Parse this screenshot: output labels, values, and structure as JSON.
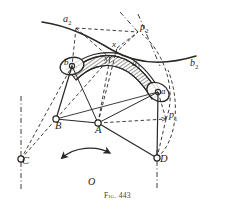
{
  "figure": {
    "caption": "Fig. 443",
    "center_label": "O",
    "ink_color": "#2a2724",
    "background_color": "#ffffff"
  },
  "labels": {
    "a2": {
      "base": "a",
      "sub": "2"
    },
    "p2": {
      "base": "p",
      "sub": "2"
    },
    "b2": {
      "base": "b",
      "sub": "2"
    },
    "a1": {
      "base": "a",
      "sub": "1"
    },
    "p1": {
      "base": "p",
      "sub": "1"
    },
    "x_upper": {
      "base": "x",
      "sub": ""
    },
    "x_lower": {
      "base": "x",
      "sub": ""
    },
    "a_joint": {
      "base": "a",
      "sub": ""
    },
    "b_joint": {
      "base": "b",
      "sub": ""
    },
    "A": {
      "base": "A",
      "sub": ""
    },
    "B": {
      "base": "B",
      "sub": ""
    },
    "C": {
      "base": "C",
      "sub": ""
    },
    "D": {
      "base": "D",
      "sub": ""
    }
  },
  "geometry": {
    "points": {
      "A": {
        "x": 98,
        "y": 123,
        "name": "pivot-A"
      },
      "B": {
        "x": 56,
        "y": 119,
        "name": "pivot-B"
      },
      "C": {
        "x": 21,
        "y": 159,
        "name": "pivot-C"
      },
      "D": {
        "x": 157,
        "y": 158,
        "name": "pivot-D"
      },
      "joint_a": {
        "x": 158,
        "y": 92,
        "name": "joint-a"
      },
      "joint_b": {
        "x": 72,
        "y": 65,
        "name": "joint-b"
      },
      "p1": {
        "x": 166,
        "y": 119,
        "name": "point-p1"
      },
      "p2": {
        "x": 140,
        "y": 30,
        "name": "point-p2"
      },
      "a2": {
        "x": 76,
        "y": 26,
        "name": "point-a2"
      },
      "x_upper": {
        "x": 117,
        "y": 48,
        "name": "point-x-upper"
      },
      "x_lower": {
        "x": 110,
        "y": 58,
        "name": "point-x-lower"
      }
    },
    "rotation_arrow": {
      "name": "rotation-arrow",
      "from": {
        "x": 62,
        "y": 158
      },
      "to": {
        "x": 110,
        "y": 153
      }
    }
  }
}
